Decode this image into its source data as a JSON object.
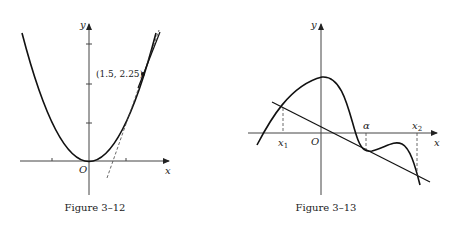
{
  "figures": [
    {
      "caption": "Figure 3–12",
      "axis_labels": {
        "x": "x",
        "y": "y",
        "origin": "O"
      },
      "curve": "y = x^2 (parabola)",
      "point_label": "(1.5, 2.25)",
      "point": [
        1.5,
        2.25
      ],
      "tangent": "dashed tangent line near x = 1 and solid secant through (1.5, 2.25)",
      "x_ticks": [
        -1,
        1
      ],
      "y_ticks": [
        1,
        2,
        3
      ]
    },
    {
      "caption": "Figure 3–13",
      "axis_labels": {
        "x": "x",
        "y": "y",
        "origin": "O"
      },
      "curve": "smooth curve with maximum on y-axis, tangent line at alpha",
      "point_labels": [
        "x₁",
        "α",
        "x₂"
      ],
      "line": "straight line tangent at alpha, intersecting curve at x1 and x2"
    }
  ],
  "labels": {
    "fig1_x": "x",
    "fig1_y": "y",
    "fig1_o": "O",
    "fig1_point": "(1.5, 2.25)",
    "fig1_caption": "Figure 3–12",
    "fig2_x": "x",
    "fig2_y": "y",
    "fig2_o": "O",
    "fig2_x1": "x",
    "fig2_x1_sub": "1",
    "fig2_alpha": "α",
    "fig2_x2": "x",
    "fig2_x2_sub": "2",
    "fig2_caption": "Figure 3–13"
  }
}
